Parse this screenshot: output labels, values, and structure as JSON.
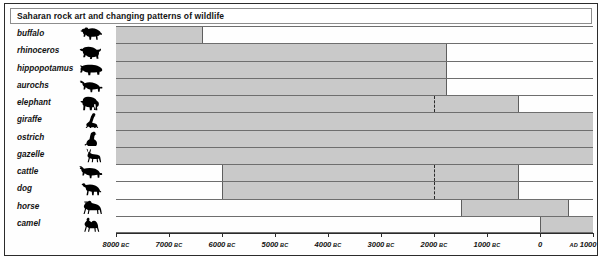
{
  "title": "Saharan rock art and changing patterns of wildlife",
  "chart_data": {
    "type": "bar",
    "orientation": "horizontal",
    "title": "Saharan rock art and changing patterns of wildlife",
    "xlabel": "",
    "ylabel": "",
    "xlim": [
      -8000,
      1000
    ],
    "x_axis_note": "negative numbers are BC, positive are AD",
    "grid": false,
    "legend": null,
    "tick_values": [
      -8000,
      -7000,
      -6000,
      -5000,
      -4000,
      -3000,
      -2000,
      -1000,
      0,
      1000
    ],
    "tick_labels": [
      {
        "value": "8000",
        "era": "BC"
      },
      {
        "value": "7000",
        "era": "BC"
      },
      {
        "value": "6000",
        "era": "BC"
      },
      {
        "value": "5000",
        "era": "BC"
      },
      {
        "value": "4000",
        "era": "BC"
      },
      {
        "value": "3000",
        "era": "BC"
      },
      {
        "value": "2000",
        "era": "BC"
      },
      {
        "value": "1000",
        "era": "BC"
      },
      {
        "value": "0",
        "era": ""
      },
      {
        "value": "1000",
        "era": "AD",
        "era_first": true
      }
    ],
    "categories": [
      "buffalo",
      "rhinoceros",
      "hippopotamus",
      "aurochs",
      "elephant",
      "giraffe",
      "ostrich",
      "gazelle",
      "cattle",
      "dog",
      "horse",
      "camel"
    ],
    "bars": [
      {
        "label": "buffalo",
        "icon": "buffalo-icon",
        "start": -8000,
        "end": -6350,
        "dashed_at": null
      },
      {
        "label": "rhinoceros",
        "icon": "rhinoceros-icon",
        "start": -8000,
        "end": -1750,
        "dashed_at": null
      },
      {
        "label": "hippopotamus",
        "icon": "hippopotamus-icon",
        "start": -8000,
        "end": -1750,
        "dashed_at": null
      },
      {
        "label": "aurochs",
        "icon": "aurochs-icon",
        "start": -8000,
        "end": -1750,
        "dashed_at": null
      },
      {
        "label": "elephant",
        "icon": "elephant-icon",
        "start": -8000,
        "end": -400,
        "dashed_at": -2000
      },
      {
        "label": "giraffe",
        "icon": "giraffe-icon",
        "start": -8000,
        "end": 1000,
        "dashed_at": null
      },
      {
        "label": "ostrich",
        "icon": "ostrich-icon",
        "start": -8000,
        "end": 1000,
        "dashed_at": null
      },
      {
        "label": "gazelle",
        "icon": "gazelle-icon",
        "start": -8000,
        "end": 1000,
        "dashed_at": null
      },
      {
        "label": "cattle",
        "icon": "cattle-icon",
        "start": -6000,
        "end": -400,
        "dashed_at": -2000
      },
      {
        "label": "dog",
        "icon": "dog-icon",
        "start": -6000,
        "end": -400,
        "dashed_at": -2000
      },
      {
        "label": "horse",
        "icon": "horse-icon",
        "start": -1500,
        "end": 550,
        "dashed_at": null
      },
      {
        "label": "camel",
        "icon": "camel-icon",
        "start": 0,
        "end": 1000,
        "dashed_at": null
      }
    ]
  },
  "colors": {
    "bar_fill": "#c9c9c9",
    "bar_edge": "#5e5e5e",
    "frame": "#2b2b2b",
    "text": "#131313",
    "background": "#ffffff"
  }
}
